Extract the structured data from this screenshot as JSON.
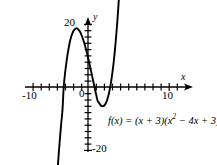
{
  "figure": {
    "background_color": "#ffffff",
    "ink_color": "#000000",
    "origin_label": "0",
    "axis_x_label": "x",
    "axis_y_label": "y",
    "equation_prefix": "f(x) = (x + 3)(x",
    "equation_exponent": "2",
    "equation_suffix": " − 4x + 3)",
    "equation_full": "f(x) = (x + 3)(x² − 4x + 3)"
  },
  "chart_data": {
    "type": "line",
    "title": "",
    "subtitle": "",
    "xlabel": "x",
    "ylabel": "y",
    "annotations": [
      "f(x) = (x + 3)(x² − 4x + 3)"
    ],
    "legend": [],
    "legend_position": "none",
    "grid": false,
    "xlim": [
      -11,
      11
    ],
    "ylim": [
      -22,
      22
    ],
    "xtick_labels": [
      "-10",
      "10"
    ],
    "ytick_labels": [
      "20",
      "-20"
    ],
    "xticks": [
      -10,
      -9,
      -8,
      -7,
      -6,
      -5,
      -4,
      -3,
      -2,
      -1,
      1,
      2,
      3,
      4,
      5,
      6,
      7,
      8,
      9,
      10
    ],
    "yticks": [
      -20,
      -18,
      -16,
      -14,
      -12,
      -10,
      -8,
      -6,
      -4,
      -2,
      2,
      4,
      6,
      8,
      10,
      12,
      14,
      16,
      18,
      20
    ],
    "xtick_step": 1,
    "ytick_step": 2,
    "xtick_label_values": [
      -10,
      10
    ],
    "ytick_label_values": [
      20,
      -20
    ],
    "axis_arrows": [
      "x-positive",
      "y-positive"
    ],
    "series": [
      {
        "name": "f(x) = (x + 3)(x² - 4x + 3)",
        "expression": "(x + 3)*(x^2 - 4*x + 3)",
        "color": "#000000",
        "roots": [
          -3,
          1,
          3
        ],
        "local_max": {
          "x": -1.12,
          "y": 16.9
        },
        "local_min": {
          "x": 2.45,
          "y": -6.1
        },
        "y_intercept": 9,
        "end_arrows": [
          "down-left",
          "up-right"
        ],
        "x": [
          -4.05,
          -3.9,
          -3.75,
          -3.6,
          -3.45,
          -3.3,
          -3.15,
          -3.0,
          -2.85,
          -2.7,
          -2.55,
          -2.4,
          -2.25,
          -2.1,
          -1.95,
          -1.8,
          -1.65,
          -1.5,
          -1.35,
          -1.2,
          -1.05,
          -0.9,
          -0.75,
          -0.6,
          -0.45,
          -0.3,
          -0.15,
          0.0,
          0.15,
          0.3,
          0.45,
          0.6,
          0.75,
          0.9,
          1.05,
          1.2,
          1.35,
          1.5,
          1.65,
          1.8,
          1.95,
          2.1,
          2.25,
          2.4,
          2.55,
          2.7,
          2.85,
          3.0,
          3.15,
          3.3,
          3.45,
          3.6,
          3.75,
          3.9,
          4.05
        ],
        "y": [
          -37.3,
          -31.4,
          -25.9,
          -20.7,
          -15.9,
          -11.4,
          -7.3,
          0.0,
          3.9,
          7.1,
          9.9,
          12.2,
          14.2,
          15.7,
          16.9,
          17.8,
          18.3,
          18.6,
          18.6,
          18.3,
          17.8,
          17.1,
          16.2,
          15.1,
          13.9,
          12.5,
          11.0,
          9.4,
          7.7,
          6.0,
          4.2,
          2.4,
          0.6,
          -1.2,
          -2.9,
          -4.5,
          -5.0,
          -5.6,
          -6.0,
          -6.1,
          -6.0,
          -5.6,
          -4.9,
          -3.8,
          -2.4,
          -0.6,
          1.6,
          4.3,
          7.4,
          11.1,
          15.3,
          20.1,
          25.5,
          31.5,
          38.2
        ]
      }
    ]
  }
}
